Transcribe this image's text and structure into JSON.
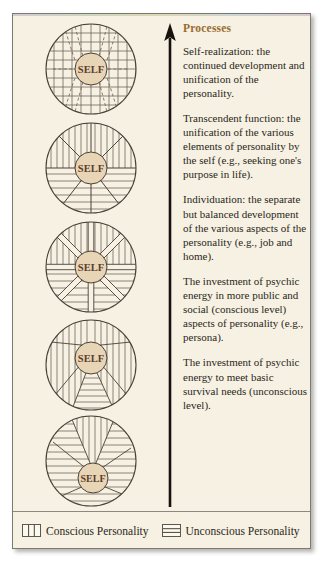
{
  "figure": {
    "background_color": "#f6f1e3",
    "border_color": "#7b7a72",
    "heading_color": "#9a6a30",
    "text_color": "#2b2720",
    "self_fill_color": "#e8d5b5",
    "line_color": "#4a4138"
  },
  "arrow": {
    "name": "upward-progress-arrow",
    "direction": "up"
  },
  "processes": {
    "heading": "Processes",
    "items": [
      {
        "id": "self-realization",
        "text": "Self-realization: the continued development and unification of the personality."
      },
      {
        "id": "transcendent-function",
        "text": "Transcendent function: the unification of the various elements of personality by the self (e.g., seeking one's purpose in life)."
      },
      {
        "id": "individuation",
        "text": "Individuation: the separate but balanced development of the various aspects of the personality (e.g., job and home)."
      },
      {
        "id": "investment-public-social",
        "text": "The investment of psychic energy in more public and social (conscious level) aspects of personality (e.g., persona)."
      },
      {
        "id": "investment-survival",
        "text": "The investment of psychic energy to meet basic survival needs (unconscious level)."
      }
    ]
  },
  "diagrams": [
    {
      "id": "stage-5-self-realization",
      "center_label": "SELF",
      "pattern": "full-grid-integrated"
    },
    {
      "id": "stage-4-transcendent-function",
      "center_label": "SELF",
      "pattern": "half-vertical-half-horizontal-radial"
    },
    {
      "id": "stage-3-individuation",
      "center_label": "SELF",
      "pattern": "segmented-spokes"
    },
    {
      "id": "stage-2-public-social",
      "center_label": "SELF",
      "pattern": "mostly-vertical-lower-cone-horizontal"
    },
    {
      "id": "stage-1-survival",
      "center_label": "SELF",
      "pattern": "mostly-horizontal-upper-cone-vertical"
    }
  ],
  "legend": {
    "entries": [
      {
        "id": "conscious-personality",
        "label": "Conscious Personality",
        "pattern": "vertical-lines"
      },
      {
        "id": "unconscious-personality",
        "label": "Unconscious Personality",
        "pattern": "horizontal-lines"
      }
    ]
  }
}
